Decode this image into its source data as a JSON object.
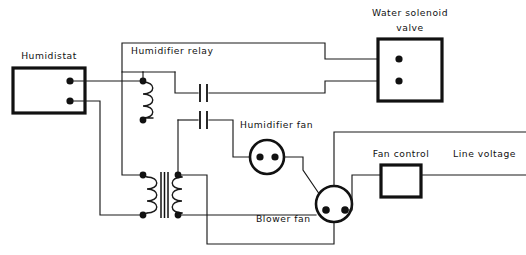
{
  "diagram": {
    "type": "schematic",
    "background_color": "#ffffff",
    "line_color": "#111111",
    "labels": {
      "humidistat": "Humidistat",
      "humidifier_relay": "Humidifier relay",
      "water_solenoid_valve_line1": "Water solenoid",
      "water_solenoid_valve_line2": "valve",
      "humidifier_fan": "Humidifier fan",
      "blower_fan": "Blower fan",
      "fan_control": "Fan control",
      "line_voltage": "Line voltage"
    },
    "components": [
      {
        "id": "humidistat",
        "name": "Humidistat",
        "symbol": "rectangular-enclosure",
        "terminals": 2,
        "x": 13,
        "y": 68,
        "width": 72,
        "height": 45
      },
      {
        "id": "humidifier-relay",
        "name": "Humidifier relay",
        "symbol": "relay-coil-with-two-contacts",
        "terminals": 2,
        "contacts": 2
      },
      {
        "id": "water-solenoid-valve",
        "name": "Water solenoid valve",
        "symbol": "rectangular-enclosure",
        "terminals": 2,
        "x": 378,
        "y": 39,
        "width": 64,
        "height": 62
      },
      {
        "id": "transformer",
        "name": "Transformer",
        "symbol": "two-winding-iron-core-transformer",
        "terminals": 4
      },
      {
        "id": "humidifier-fan",
        "name": "Humidifier fan",
        "symbol": "motor-circle",
        "terminals": 2,
        "cx": 267,
        "cy": 157,
        "r": 17
      },
      {
        "id": "blower-fan",
        "name": "Blower fan",
        "symbol": "motor-circle",
        "terminals": 2,
        "cx": 334,
        "cy": 204,
        "r": 18
      },
      {
        "id": "fan-control",
        "name": "Fan control",
        "symbol": "rectangular-enclosure",
        "terminals": 2,
        "x": 381,
        "y": 165,
        "width": 40,
        "height": 32
      },
      {
        "id": "line-voltage",
        "name": "Line voltage",
        "symbol": "supply-conductors",
        "conductors": 2
      }
    ]
  }
}
